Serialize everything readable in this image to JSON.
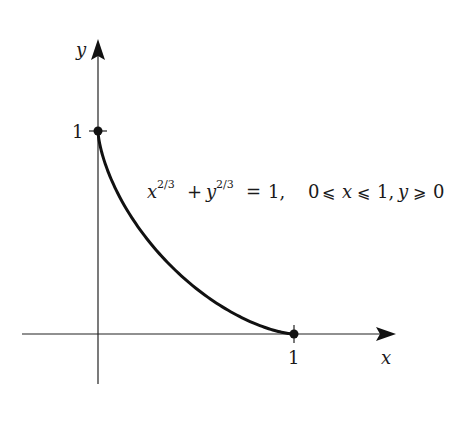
{
  "diagram": {
    "type": "function-graph",
    "curve": {
      "equation": "x^(2/3) + y^(2/3) = 1",
      "domain": "0 ≤ x ≤ 1, y ≥ 0",
      "x_range": [
        0,
        1
      ],
      "y_range": [
        0,
        1
      ]
    },
    "axes": {
      "x_label": "x",
      "y_label": "y"
    },
    "ticks": {
      "x_tick_label": "1",
      "y_tick_label": "1"
    },
    "points": [
      {
        "name": "y-intercept",
        "x": 0,
        "y": 1
      },
      {
        "name": "x-intercept",
        "x": 1,
        "y": 0
      }
    ],
    "annotation": {
      "lhs_x": "x",
      "exp1": "2/3",
      "plus": "+",
      "lhs_y": "y",
      "exp2": "2/3",
      "equals": "=",
      "rhs": "1,",
      "cond_zero": "0",
      "leq1": "⩽",
      "cond_x": "x",
      "leq2": "⩽",
      "cond_one": "1,",
      "cond_y": "y",
      "geq": "⩾",
      "cond_zero2": "0"
    },
    "colors": {
      "ink": "#111111",
      "background": "#ffffff"
    }
  }
}
